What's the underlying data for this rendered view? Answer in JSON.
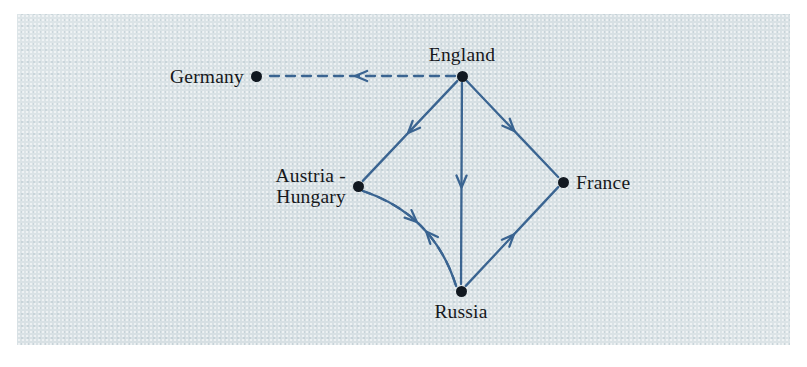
{
  "figure": {
    "type": "directed-graph-diagram",
    "title": "",
    "panel": {
      "x": 17,
      "y": 14,
      "width": 773,
      "height": 331,
      "background_color": "#dbe3e6"
    },
    "edge_color": "#3a6491",
    "node_color": "#111820",
    "label_color": "#16181c"
  },
  "chart_data": {
    "type": "diagram",
    "title": "",
    "nodes": [
      {
        "id": "germany",
        "label": "Germany",
        "x": 256,
        "y": 76,
        "label_position": "left"
      },
      {
        "id": "england",
        "label": "England",
        "x": 462,
        "y": 76,
        "label_position": "above"
      },
      {
        "id": "austria",
        "label": "Austria -\nHungary",
        "x": 358,
        "y": 186,
        "label_position": "left"
      },
      {
        "id": "france",
        "label": "France",
        "x": 563,
        "y": 182,
        "label_position": "right"
      },
      {
        "id": "russia",
        "label": "Russia",
        "x": 461,
        "y": 291,
        "label_position": "below"
      }
    ],
    "edges": [
      {
        "id": "england-germany",
        "from": "england",
        "to": "germany",
        "style": "dashed",
        "shape": "straight",
        "directed": true,
        "arrow_at": "midpoint"
      },
      {
        "id": "england-austria",
        "from": "england",
        "to": "austria",
        "style": "solid",
        "shape": "straight",
        "directed": true,
        "arrow_at": "midpoint"
      },
      {
        "id": "england-russia",
        "from": "england",
        "to": "russia",
        "style": "solid",
        "shape": "straight",
        "directed": true,
        "arrow_at": "midpoint"
      },
      {
        "id": "england-france",
        "from": "england",
        "to": "france",
        "style": "solid",
        "shape": "straight",
        "directed": true,
        "arrow_at": "midpoint"
      },
      {
        "id": "russia-france",
        "from": "russia",
        "to": "france",
        "style": "solid",
        "shape": "straight",
        "directed": true,
        "arrow_at": "midpoint"
      },
      {
        "id": "austria-russia",
        "from": "austria",
        "to": "russia",
        "style": "dashed",
        "shape": "curve-right",
        "directed": true,
        "arrow_at": "midpoint"
      },
      {
        "id": "russia-austria",
        "from": "russia",
        "to": "austria",
        "style": "solid",
        "shape": "curve-left",
        "directed": true,
        "arrow_at": "midpoint"
      }
    ],
    "legend": [],
    "annotations": []
  }
}
